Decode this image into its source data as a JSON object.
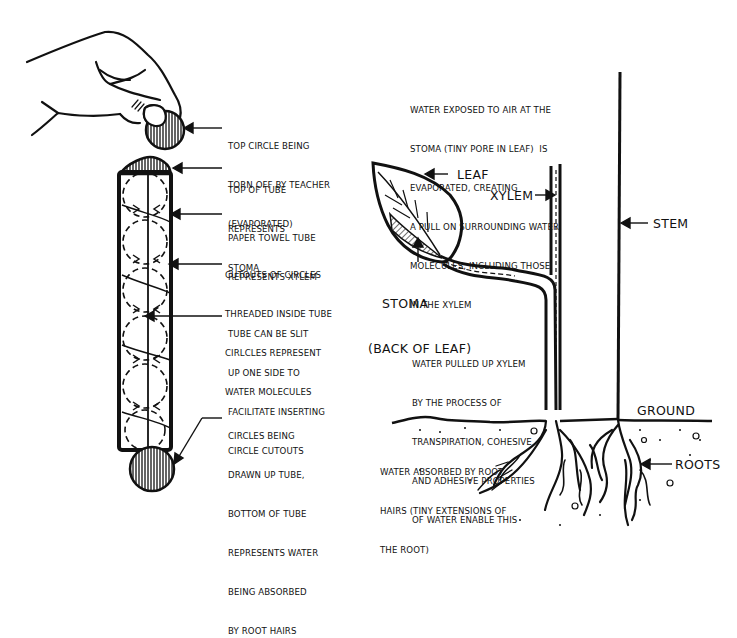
{
  "diagram": {
    "left_model": {
      "labels": {
        "top_circle": [
          "TOP CIRCLE BEING",
          "TORN OFF BY TEACHER",
          "(EVAPORATED)"
        ],
        "top_of_tube": [
          "TOP OF TUBE",
          "REPRESENTS",
          "STOMA"
        ],
        "paper_tube": [
          "PAPER TOWEL TUBE",
          "REPRESENTS XYLEM"
        ],
        "cutouts": [
          "CUTOUTS OF CIRCLES",
          "THREADED INSIDE TUBE",
          "CIRLCLES REPRESENT",
          "WATER MOLECULES"
        ],
        "slit": [
          "TUBE CAN BE SLIT",
          "UP ONE SIDE TO",
          "FACILITATE INSERTING",
          "CIRCLE CUTOUTS"
        ],
        "bottom": [
          "CIRCLES BEING",
          "DRAWN UP TUBE,",
          "BOTTOM OF TUBE",
          "REPRESENTS WATER",
          "BEING ABSORBED",
          "BY ROOT HAIRS"
        ]
      },
      "icons": [
        "hand-icon",
        "paper-tube-icon",
        "circle-cutout-icon"
      ]
    },
    "right_plant": {
      "labels": {
        "evaporation": [
          "WATER EXPOSED TO AIR AT THE",
          "STOMA (TINY PORE IN LEAF)  IS",
          "EVAPORATED, CREATING",
          "A PULL ON SURROUNDING WATER",
          "MOLECULES, INCLUDING THOSE",
          "IN THE XYLEM"
        ],
        "leaf": "LEAF",
        "xylem": "XYLEM",
        "stem": "STEM",
        "stoma": [
          "STOMA",
          "(BACK OF LEAF)"
        ],
        "pulled": [
          "WATER PULLED UP XYLEM",
          "BY THE PROCESS OF",
          "TRANSPIRATION, COHESIVE",
          "AND ADHESIVE PROPERTIES",
          "OF WATER ENABLE THIS"
        ],
        "ground": "GROUND",
        "absorbed": [
          "WATER ABSORBED BY ROOT",
          "HAIRS (TINY EXTENSIONS OF",
          "THE ROOT)"
        ],
        "roots": "ROOTS"
      },
      "icons": [
        "leaf-icon",
        "stem-icon",
        "xylem-icon",
        "roots-icon",
        "ground-line-icon"
      ]
    },
    "colors": {
      "ink": "#111111",
      "background": "#ffffff"
    }
  }
}
